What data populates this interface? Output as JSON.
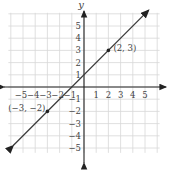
{
  "chart_data": {
    "type": "line",
    "title": "",
    "xlabel": "",
    "ylabel": "y",
    "xlim": [
      -6,
      6
    ],
    "ylim": [
      -6,
      6
    ],
    "grid": true,
    "x_ticks": [
      "-5",
      "-4",
      "-3",
      "-2",
      "-1",
      "1",
      "2",
      "3",
      "4",
      "5"
    ],
    "y_ticks": [
      "5",
      "4",
      "3",
      "2",
      "1",
      "-1",
      "-2",
      "-3",
      "-4",
      "-5"
    ],
    "series": [
      {
        "name": "line",
        "equation": "y = x + 1",
        "x": [
          -6,
          5
        ],
        "y": [
          -5,
          6
        ]
      }
    ],
    "points": [
      {
        "x": 2,
        "y": 3,
        "label": "(2, 3)"
      },
      {
        "x": -3,
        "y": -2,
        "label": "(−3, −2)"
      }
    ],
    "colors": {
      "line": "#3a3a3a",
      "grid": "#d8d8d8",
      "axis": "#222222"
    }
  }
}
